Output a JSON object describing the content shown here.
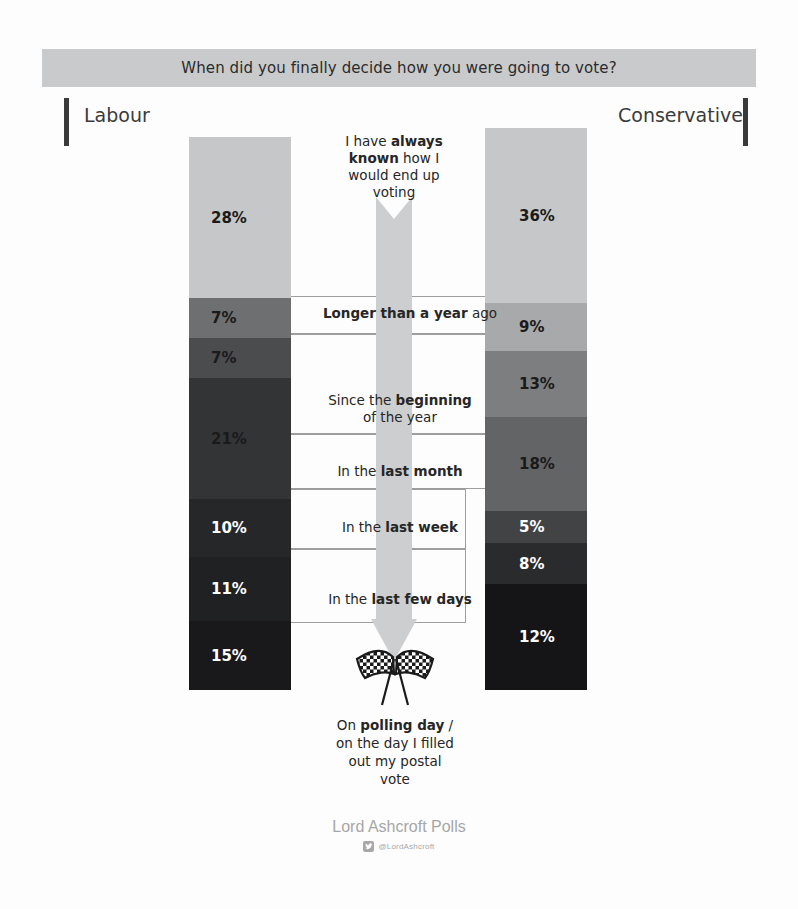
{
  "header": {
    "question": "When did you finally decide how you were going to vote?"
  },
  "parties": {
    "left": "Labour",
    "right": "Conservative"
  },
  "footer": {
    "brand": "Lord Ashcroft Polls",
    "handle": "@LordAshcroft",
    "twitter_icon": "twitter-bird-icon"
  },
  "icons": {
    "flags": "checkered-flags-icon",
    "arrow": "down-arrow-icon"
  },
  "categories": [
    {
      "id": "always-known",
      "label_html": "I have <b>always known</b> how I would end up voting",
      "label_text": "I have always known how I would end up voting"
    },
    {
      "id": "longer-than-a-year",
      "label_html": "<b>Longer than a year</b> ago",
      "label_text": "Longer than a year ago"
    },
    {
      "id": "since-beginning-of-year",
      "label_html": "Since the <b>beginning</b><br>of the year",
      "label_text": "Since the beginning of the year"
    },
    {
      "id": "last-month",
      "label_html": "In the <b>last month</b>",
      "label_text": "In the last month"
    },
    {
      "id": "last-week",
      "label_html": "In the <b>last week</b>",
      "label_text": "In the last week"
    },
    {
      "id": "last-few-days",
      "label_html": "In the <b>last few days</b>",
      "label_text": "In the last few days"
    },
    {
      "id": "polling-day",
      "label_html": "On <b>polling day</b> /<br>on the day I filled<br>out my postal<br>vote",
      "label_text": "On polling day / on the day I filled out my postal vote"
    }
  ],
  "chart_data": {
    "type": "bar",
    "title": "When did you finally decide how you were going to vote?",
    "subtitle": "",
    "xlabel": "",
    "ylabel": "",
    "orientation": "vertical-stacked",
    "stacked": true,
    "units": "percent",
    "grid": false,
    "legend_position": "none",
    "categories": [
      "I have always known how I would end up voting",
      "Longer than a year ago",
      "Since the beginning of the year",
      "In the last month",
      "In the last week",
      "In the last few days",
      "On polling day / on the day I filled out my postal vote"
    ],
    "series": [
      {
        "name": "Labour",
        "values": [
          28,
          7,
          7,
          21,
          10,
          11,
          15
        ],
        "value_labels": [
          "28%",
          "7%",
          "7%",
          "21%",
          "10%",
          "11%",
          "15%"
        ],
        "label_colors": [
          "#1a1a1a",
          "#1a1a1a",
          "#1a1a1a",
          "#1a1a1a",
          "#ffffff",
          "#ffffff",
          "#ffffff"
        ]
      },
      {
        "name": "Conservative",
        "values": [
          36,
          9,
          13,
          18,
          5,
          8,
          12
        ],
        "value_labels": [
          "36%",
          "9%",
          "13%",
          "18%",
          "5%",
          "8%",
          "12%"
        ],
        "label_colors": [
          "#1a1a1a",
          "#1a1a1a",
          "#1a1a1a",
          "#1a1a1a",
          "#ffffff",
          "#ffffff",
          "#ffffff"
        ]
      }
    ],
    "band_colors": [
      "#c6c7c8",
      "#9a9b9c",
      "#6e6f70",
      "#58595b",
      "#464749",
      "#303133",
      "#1c1d1f"
    ],
    "banner_color": "#c9cacb",
    "arrow_color": "#cdcecf",
    "ylim": [
      0,
      100
    ]
  }
}
